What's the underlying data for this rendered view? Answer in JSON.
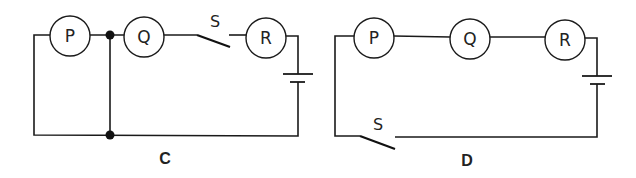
{
  "figure": {
    "colors": {
      "ink": "#1a1a1a",
      "background": "#ffffff"
    }
  },
  "circuit_c": {
    "label": "C",
    "lamps": [
      {
        "label": "P"
      },
      {
        "label": "Q"
      },
      {
        "label": "R"
      }
    ],
    "switch": {
      "label": "S",
      "state": "open",
      "position": "between Q and R"
    },
    "cell": {
      "position": "right side"
    },
    "junctions": 2,
    "notes": "Vertical wire from junction between P and Q to bottom wire short-circuits P"
  },
  "circuit_d": {
    "label": "D",
    "lamps": [
      {
        "label": "P"
      },
      {
        "label": "Q"
      },
      {
        "label": "R"
      }
    ],
    "switch": {
      "label": "S",
      "state": "open",
      "position": "bottom-left wire"
    },
    "cell": {
      "position": "right side"
    },
    "notes": "All three lamps in series with cell and switch"
  }
}
